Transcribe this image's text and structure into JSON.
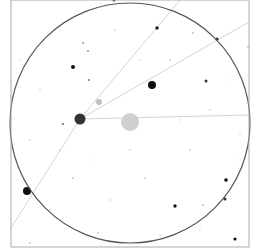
{
  "chart_data": {
    "type": "scatter",
    "title": "",
    "frame": {
      "x": 11,
      "y": 0,
      "width": 238,
      "height": 247,
      "stroke": "#aaaaaa"
    },
    "fov_circle": {
      "cx": 130,
      "cy": 123,
      "r": 120,
      "stroke": "#555555"
    },
    "target": {
      "cx": 130,
      "cy": 122,
      "r": 9,
      "fill": "#cfcfcf"
    },
    "guide_lines": [
      {
        "x1": 80,
        "y1": 119,
        "x2": 249,
        "y2": 115
      },
      {
        "x1": 80,
        "y1": 119,
        "x2": 249,
        "y2": 22
      },
      {
        "x1": 80,
        "y1": 119,
        "x2": 180,
        "y2": 0
      },
      {
        "x1": 80,
        "y1": 119,
        "x2": 11,
        "y2": 228
      }
    ],
    "line_color": "#d4d4d4",
    "stars": [
      {
        "x": 80,
        "y": 119,
        "r": 5.5,
        "fill": "#333333"
      },
      {
        "x": 152,
        "y": 85,
        "r": 4,
        "fill": "#111111"
      },
      {
        "x": 27,
        "y": 191,
        "r": 4,
        "fill": "#111111"
      },
      {
        "x": 99,
        "y": 102,
        "r": 3,
        "fill": "#c0c0c0"
      },
      {
        "x": 73,
        "y": 67,
        "r": 2,
        "fill": "#111111"
      },
      {
        "x": 157,
        "y": 28,
        "r": 1.8,
        "fill": "#222222"
      },
      {
        "x": 217,
        "y": 39,
        "r": 1.6,
        "fill": "#333333"
      },
      {
        "x": 206,
        "y": 81,
        "r": 1.5,
        "fill": "#333333"
      },
      {
        "x": 226,
        "y": 180,
        "r": 1.8,
        "fill": "#111111"
      },
      {
        "x": 225,
        "y": 199,
        "r": 1.5,
        "fill": "#333333"
      },
      {
        "x": 175,
        "y": 206,
        "r": 1.7,
        "fill": "#111111"
      },
      {
        "x": 235,
        "y": 239,
        "r": 1.6,
        "fill": "#111111"
      },
      {
        "x": 114,
        "y": 0,
        "r": 1.5,
        "fill": "#333333"
      },
      {
        "x": 89,
        "y": 80,
        "r": 1,
        "fill": "#777777"
      },
      {
        "x": 83,
        "y": 43,
        "r": 0.9,
        "fill": "#888888"
      },
      {
        "x": 88,
        "y": 51,
        "r": 0.9,
        "fill": "#888888"
      },
      {
        "x": 63,
        "y": 124,
        "r": 1,
        "fill": "#666666"
      },
      {
        "x": 193,
        "y": 33,
        "r": 0.8,
        "fill": "#999999"
      },
      {
        "x": 248,
        "y": 47,
        "r": 0.8,
        "fill": "#999999"
      },
      {
        "x": 203,
        "y": 205,
        "r": 0.8,
        "fill": "#999999"
      },
      {
        "x": 73,
        "y": 178,
        "r": 0.8,
        "fill": "#999999"
      },
      {
        "x": 30,
        "y": 243,
        "r": 0.8,
        "fill": "#999999"
      },
      {
        "x": 98,
        "y": 233,
        "r": 0.8,
        "fill": "#aaaaaa"
      },
      {
        "x": 145,
        "y": 178,
        "r": 0.8,
        "fill": "#aaaaaa"
      },
      {
        "x": 60,
        "y": 150,
        "r": 0.7,
        "fill": "#aaaaaa"
      },
      {
        "x": 190,
        "y": 150,
        "r": 0.7,
        "fill": "#aaaaaa"
      },
      {
        "x": 170,
        "y": 60,
        "r": 0.7,
        "fill": "#aaaaaa"
      },
      {
        "x": 115,
        "y": 30,
        "r": 0.7,
        "fill": "#aaaaaa"
      },
      {
        "x": 40,
        "y": 90,
        "r": 0.7,
        "fill": "#bbbbbb"
      },
      {
        "x": 210,
        "y": 110,
        "r": 0.7,
        "fill": "#bbbbbb"
      },
      {
        "x": 110,
        "y": 200,
        "r": 0.7,
        "fill": "#bbbbbb"
      },
      {
        "x": 50,
        "y": 210,
        "r": 0.7,
        "fill": "#bbbbbb"
      },
      {
        "x": 240,
        "y": 160,
        "r": 0.7,
        "fill": "#bbbbbb"
      },
      {
        "x": 160,
        "y": 235,
        "r": 0.7,
        "fill": "#bbbbbb"
      },
      {
        "x": 130,
        "y": 150,
        "r": 0.7,
        "fill": "#bbbbbb"
      },
      {
        "x": 30,
        "y": 140,
        "r": 0.7,
        "fill": "#bbbbbb"
      },
      {
        "x": 140,
        "y": 60,
        "r": 0.7,
        "fill": "#bbbbbb"
      },
      {
        "x": 60,
        "y": 30,
        "r": 0.7,
        "fill": "#cccccc"
      },
      {
        "x": 230,
        "y": 80,
        "r": 0.7,
        "fill": "#cccccc"
      },
      {
        "x": 200,
        "y": 230,
        "r": 0.7,
        "fill": "#cccccc"
      },
      {
        "x": 90,
        "y": 160,
        "r": 0.7,
        "fill": "#cccccc"
      },
      {
        "x": 180,
        "y": 120,
        "r": 0.7,
        "fill": "#cccccc"
      },
      {
        "x": 20,
        "y": 60,
        "r": 0.7,
        "fill": "#cccccc"
      },
      {
        "x": 240,
        "y": 135,
        "r": 0.7,
        "fill": "#cccccc"
      }
    ]
  }
}
